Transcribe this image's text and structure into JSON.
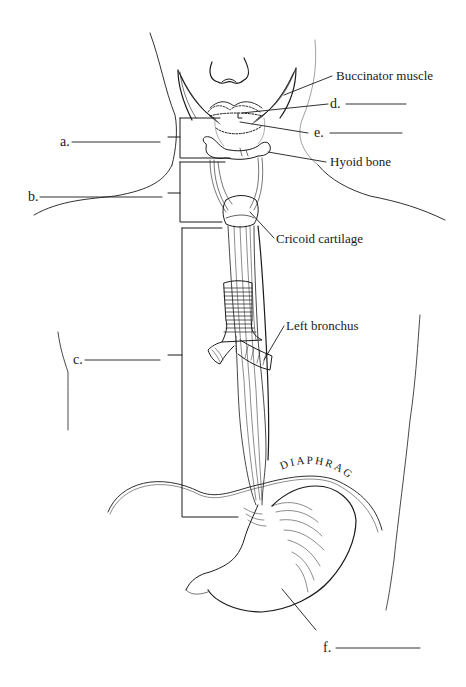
{
  "diagram": {
    "colors": {
      "line": "#1a1a1a",
      "background": "#ffffff"
    },
    "given_labels": {
      "buccinator": "Buccinator muscle",
      "hyoid": "Hyoid bone",
      "cricoid": "Cricoid cartilage",
      "bronchus": "Left bronchus",
      "diaphragm": "DIAPHRAGM"
    },
    "blank_labels": {
      "a": "a.",
      "b": "b.",
      "c": "c.",
      "d": "d.",
      "e": "e.",
      "f": "f."
    }
  }
}
